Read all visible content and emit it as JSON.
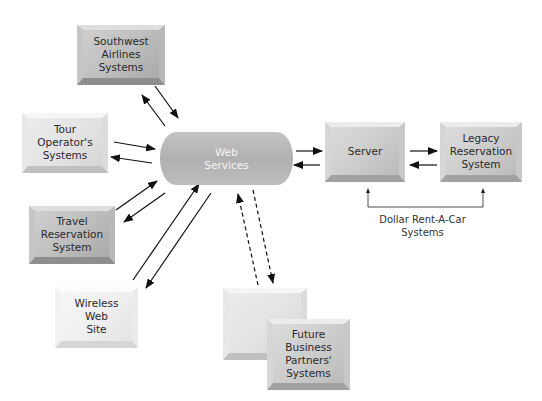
{
  "diagram": {
    "hub": {
      "label": "Web\nServices"
    },
    "nodes": [
      {
        "id": "southwest",
        "label": "Southwest\nAirlines\nSystems"
      },
      {
        "id": "tour",
        "label": "Tour\nOperator's\nSystems"
      },
      {
        "id": "travel",
        "label": "Travel\nReservation\nSystem"
      },
      {
        "id": "wireless",
        "label": "Wireless\nWeb\nSite"
      },
      {
        "id": "server",
        "label": "Server"
      },
      {
        "id": "legacy",
        "label": "Legacy\nReservation\nSystem"
      },
      {
        "id": "future_back",
        "label": ""
      },
      {
        "id": "future",
        "label": "Future\nBusiness\nPartners'\nSystems"
      }
    ],
    "group_label": "Dollar Rent-A-Car\nSystems",
    "connections": [
      {
        "from": "southwest",
        "to": "web_services",
        "style": "solid",
        "bidirectional": true
      },
      {
        "from": "tour",
        "to": "web_services",
        "style": "solid",
        "bidirectional": true
      },
      {
        "from": "travel",
        "to": "web_services",
        "style": "solid",
        "bidirectional": true
      },
      {
        "from": "wireless",
        "to": "web_services",
        "style": "solid",
        "bidirectional": true
      },
      {
        "from": "web_services",
        "to": "server",
        "style": "solid",
        "bidirectional": true
      },
      {
        "from": "server",
        "to": "legacy",
        "style": "solid",
        "bidirectional": true
      },
      {
        "from": "future",
        "to": "web_services",
        "style": "dashed",
        "bidirectional": true
      }
    ]
  }
}
